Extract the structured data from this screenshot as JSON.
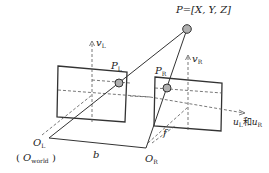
{
  "diagram": {
    "point": {
      "label": "P=[X, Y, Z]"
    },
    "left_image_point": {
      "main": "P",
      "sub": "L"
    },
    "right_image_point": {
      "main": "P",
      "sub": "R"
    },
    "left_v_axis": {
      "main": "v",
      "sub": "L"
    },
    "right_v_axis": {
      "main": "v",
      "sub": "R"
    },
    "u_axis": {
      "main1": "u",
      "sub1": "L",
      "joiner": "和",
      "main2": "u",
      "sub2": "R"
    },
    "left_origin": {
      "main": "O",
      "sub": "L"
    },
    "world_origin": {
      "open": "(",
      "main": "O",
      "sub": "world",
      "close": ")"
    },
    "right_origin": {
      "main": "O",
      "sub": "R"
    },
    "baseline": "b",
    "focal_length": "f",
    "colors": {
      "line": "#333333",
      "point_fill": "#b0b0b0",
      "dash": "#555555"
    }
  }
}
